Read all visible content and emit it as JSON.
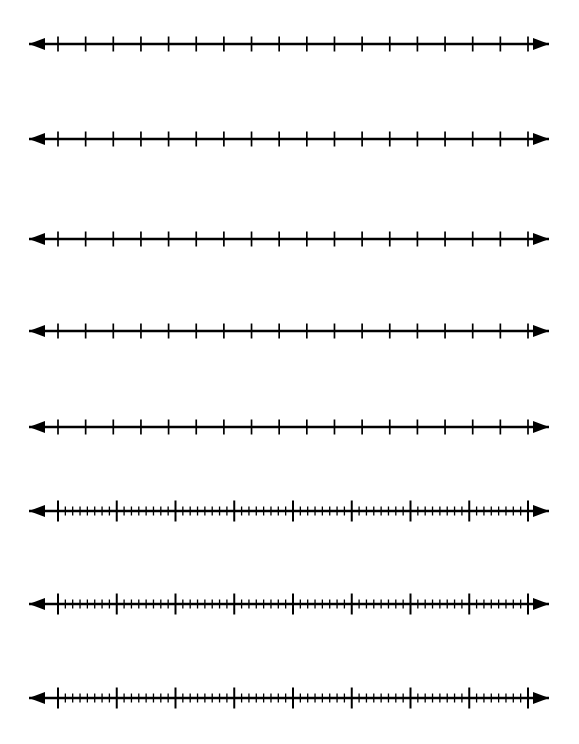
{
  "page": {
    "background_color": "#ffffff",
    "ink_color": "#000000",
    "width": 579,
    "height": 744
  },
  "chart_data": {
    "type": "line",
    "subtitle": "",
    "xlabel": "",
    "ylabel": "",
    "grid": false,
    "legend": null,
    "axis_style": "double-headed-arrow",
    "line_geometry": {
      "arrow_left_tip_x": 29,
      "arrow_right_tip_x": 549,
      "axis_start_x": 58,
      "axis_end_x": 528,
      "stroke_width": 2.6,
      "arrowhead_length": 16,
      "arrowhead_half_width": 6
    },
    "tick_styles": {
      "sparse": {
        "major_count": 18,
        "major_spacing": 27.65,
        "major_height": 15,
        "major_width": 1.7,
        "minor_per_interval": 0,
        "minor_height": 0
      },
      "dense": {
        "major_count": 9,
        "major_spacing": 58.75,
        "major_height": 21,
        "major_width": 2.0,
        "minor_per_interval": 7,
        "minor_spacing": 7.34,
        "minor_height": 9,
        "minor_width": 1.3
      }
    },
    "lines": [
      {
        "index": 1,
        "label": "number-line-1",
        "y": 44,
        "style": "sparse",
        "major_ticks": 18,
        "minor_ticks_per_interval": 0
      },
      {
        "index": 2,
        "label": "number-line-2",
        "y": 139,
        "style": "sparse",
        "major_ticks": 18,
        "minor_ticks_per_interval": 0
      },
      {
        "index": 3,
        "label": "number-line-3",
        "y": 239,
        "style": "sparse",
        "major_ticks": 18,
        "minor_ticks_per_interval": 0
      },
      {
        "index": 4,
        "label": "number-line-4",
        "y": 331,
        "style": "sparse",
        "major_ticks": 18,
        "minor_ticks_per_interval": 0
      },
      {
        "index": 5,
        "label": "number-line-5",
        "y": 427,
        "style": "sparse",
        "major_ticks": 18,
        "minor_ticks_per_interval": 0
      },
      {
        "index": 6,
        "label": "number-line-6",
        "y": 511,
        "style": "dense",
        "major_ticks": 9,
        "minor_ticks_per_interval": 7
      },
      {
        "index": 7,
        "label": "number-line-7",
        "y": 604,
        "style": "dense",
        "major_ticks": 9,
        "minor_ticks_per_interval": 7
      },
      {
        "index": 8,
        "label": "number-line-8",
        "y": 698,
        "style": "dense",
        "major_ticks": 9,
        "minor_ticks_per_interval": 7
      }
    ],
    "tick_labels": [],
    "annotations": []
  }
}
